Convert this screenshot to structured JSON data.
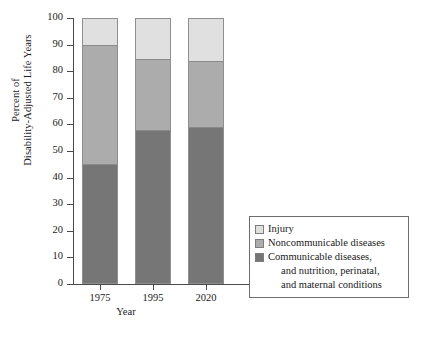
{
  "chart_data": {
    "type": "bar",
    "subtype": "stacked-bar",
    "title": "",
    "xlabel": "Year",
    "ylabel": "Percent of Disability-Adjusted Life Years",
    "ylabel_lines": [
      "Percent of",
      "Disability-Adjusted Life Years"
    ],
    "categories": [
      "1975",
      "1995",
      "2020"
    ],
    "ylim": [
      0,
      100
    ],
    "yticks": [
      100,
      90,
      80,
      70,
      60,
      50,
      40,
      30,
      20,
      10,
      0
    ],
    "grid": false,
    "legend_position": "lower-right-inside",
    "series": [
      {
        "name": "Communicable diseases, and nutrition, perinatal, and maternal conditions",
        "short_name": "Communicable diseases",
        "color": "#767676",
        "values": [
          45,
          58,
          59
        ]
      },
      {
        "name": "Noncommunicable diseases",
        "short_name": "Noncommunicable diseases",
        "color": "#acacac",
        "values": [
          45,
          27,
          25
        ]
      },
      {
        "name": "Injury",
        "short_name": "Injury",
        "color": "#e0e0e0",
        "values": [
          10,
          15,
          16
        ]
      }
    ]
  },
  "axes": {
    "y_title_line1": "Percent of",
    "y_title_line2": "Disability-Adjusted Life Years",
    "x_title": "Year",
    "ytick_labels": [
      "100",
      "90",
      "80",
      "70",
      "60",
      "50",
      "40",
      "30",
      "20",
      "10",
      "0"
    ],
    "xtick_labels": [
      "1975",
      "1995",
      "2020"
    ]
  },
  "legend": {
    "entries": [
      {
        "label": "Injury",
        "color": "#e0e0e0",
        "extra_lines": []
      },
      {
        "label": "Noncommunicable diseases",
        "color": "#acacac",
        "extra_lines": []
      },
      {
        "label": "Communicable diseases,",
        "color": "#767676",
        "extra_lines": [
          "and nutrition, perinatal,",
          "and maternal conditions"
        ]
      }
    ],
    "entry_0_label": "Injury",
    "entry_1_label": "Noncommunicable diseases",
    "entry_2_label": "Communicable diseases,",
    "entry_2_line2": "and nutrition, perinatal,",
    "entry_2_line3": "and maternal conditions"
  },
  "colors": {
    "injury": "#e0e0e0",
    "noncommunicable": "#acacac",
    "communicable": "#767676",
    "axis": "#4a4a4a",
    "background": "#ffffff"
  }
}
